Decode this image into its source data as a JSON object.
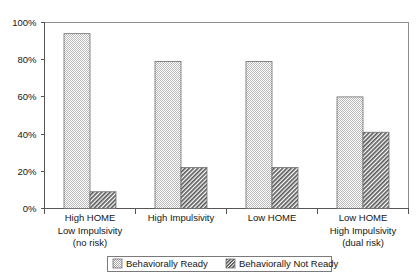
{
  "chart_data": {
    "type": "bar",
    "title": "",
    "subtitle": "",
    "xlabel": "",
    "ylabel": "",
    "ylim": [
      0,
      100
    ],
    "ytick_labels": [
      "0%",
      "20%",
      "40%",
      "60%",
      "80%",
      "100%"
    ],
    "ytick_values": [
      0,
      20,
      40,
      60,
      80,
      100
    ],
    "grid": false,
    "legend_position": "bottom",
    "categories": [
      "High HOME\nLow Impulsivity\n(no risk)",
      "High Impulsivity",
      "Low HOME",
      "Low HOME\nHigh Impulsivity\n(dual risk)"
    ],
    "category_lines": [
      [
        "High HOME",
        "Low Impulsivity",
        "(no risk)"
      ],
      [
        "High Impulsivity"
      ],
      [
        "Low HOME"
      ],
      [
        "Low HOME",
        "High Impulsivity",
        "(dual risk)"
      ]
    ],
    "series": [
      {
        "name": "Behaviorally Ready",
        "values": [
          94,
          79,
          79,
          60
        ],
        "pattern": "dotted-checker",
        "color": "#d8d8d8"
      },
      {
        "name": "Behaviorally Not Ready",
        "values": [
          9,
          22,
          22,
          41
        ],
        "pattern": "diagonal-hatch",
        "color": "#787878"
      }
    ]
  },
  "yaxis": {
    "ticks": [
      {
        "label": "100%",
        "value": 100
      },
      {
        "label": "80%",
        "value": 80
      },
      {
        "label": "60%",
        "value": 60
      },
      {
        "label": "40%",
        "value": 40
      },
      {
        "label": "20%",
        "value": 20
      },
      {
        "label": "0%",
        "value": 0
      }
    ]
  },
  "xaxis": {
    "groups": [
      {
        "lines": [
          "High HOME",
          "Low Impulsivity",
          "(no risk)"
        ]
      },
      {
        "lines": [
          "High Impulsivity"
        ]
      },
      {
        "lines": [
          "Low HOME"
        ]
      },
      {
        "lines": [
          "Low HOME",
          "High Impulsivity",
          "(dual risk)"
        ]
      }
    ]
  },
  "legend": {
    "entries": [
      {
        "label": "Behaviorally Ready",
        "swatch": "dotted-checker"
      },
      {
        "label": "Behaviorally Not Ready",
        "swatch": "diagonal-hatch"
      }
    ]
  }
}
